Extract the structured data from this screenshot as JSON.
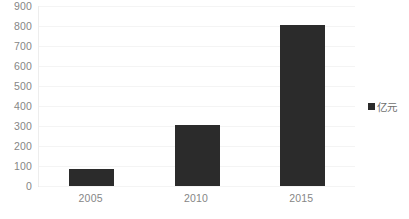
{
  "chart_data": {
    "type": "bar",
    "title": "",
    "subtitle": "",
    "xlabel": "",
    "ylabel": "",
    "categories": [
      "2005",
      "2010",
      "2015"
    ],
    "series": [
      {
        "name": "亿元",
        "values": [
          85,
          305,
          805
        ],
        "color": "#2b2b2b"
      }
    ],
    "ylim": [
      0,
      900
    ],
    "ytick_step": 100,
    "yticks": [
      "900",
      "800",
      "700",
      "600",
      "500",
      "400",
      "300",
      "200",
      "100",
      "0"
    ],
    "grid": true,
    "grid_axis": "y",
    "legend": {
      "position": "right",
      "entries": [
        {
          "label": "亿元",
          "marker": "square",
          "color": "#2b2b2b"
        }
      ]
    }
  },
  "colors": {
    "bar": "#2b2b2b",
    "gridline": "#f4f4f4",
    "axis": "#e3e3e3",
    "tick_text": "#868686",
    "legend_text": "#6f6f6f",
    "background": "#ffffff"
  },
  "legend": {
    "label": "亿元"
  }
}
